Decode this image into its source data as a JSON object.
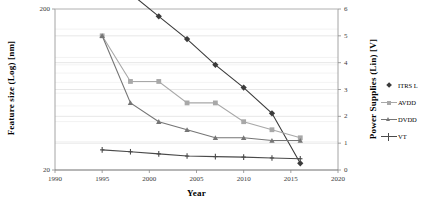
{
  "chart_data": {
    "type": "line",
    "title": "",
    "xlabel": "Year",
    "ylabel_left": "Feature size (Log) [nm]",
    "ylabel_right": "Power Supplies (Lin) [V]",
    "xlim": [
      1990,
      2020
    ],
    "xticks": [
      1990,
      1995,
      2000,
      2005,
      2010,
      2015,
      2020
    ],
    "xtick_labels": [
      "1990",
      "1995",
      "2000",
      "2005",
      "2010",
      "2015",
      "2020"
    ],
    "yleft_scale": "log",
    "yleft_lim": [
      20,
      200
    ],
    "yleft_ticks": [
      20,
      200
    ],
    "yleft_tick_labels": [
      "20",
      "200"
    ],
    "yright_scale": "linear",
    "yright_lim": [
      0,
      6
    ],
    "yright_ticks": [
      0,
      1,
      2,
      3,
      4,
      5,
      6
    ],
    "yright_tick_labels": [
      "0",
      "1",
      "2",
      "3",
      "4",
      "5",
      "6"
    ],
    "grid": true,
    "grid_orientation": "horizontal",
    "legend_position": "right-outside",
    "legend": [
      "ITRS L",
      "AVDD",
      "DVDD",
      "VT"
    ],
    "series": [
      {
        "name": "ITRS L",
        "axis": "left",
        "unit": "nm",
        "marker": "diamond",
        "color": "#3b3b3b",
        "x": [
          1995,
          1998,
          2001,
          2004,
          2007,
          2010,
          2013,
          2016
        ],
        "values": [
          350,
          250,
          180,
          130,
          90,
          65,
          45,
          22
        ]
      },
      {
        "name": "AVDD",
        "axis": "right",
        "unit": "V",
        "marker": "square",
        "color": "#a8a8a8",
        "x": [
          1995,
          1998,
          2001,
          2004,
          2007,
          2010,
          2013,
          2016
        ],
        "values": [
          5.0,
          3.3,
          3.3,
          2.5,
          2.5,
          1.8,
          1.5,
          1.2
        ]
      },
      {
        "name": "DVDD",
        "axis": "right",
        "unit": "V",
        "marker": "triangle",
        "color": "#757575",
        "x": [
          1995,
          1998,
          2001,
          2004,
          2007,
          2010,
          2013,
          2016
        ],
        "values": [
          5.0,
          2.5,
          1.8,
          1.5,
          1.2,
          1.2,
          1.1,
          1.1
        ]
      },
      {
        "name": "VT",
        "axis": "right",
        "unit": "V",
        "marker": "cross",
        "color": "#4a4a4a",
        "x": [
          1995,
          1998,
          2001,
          2004,
          2007,
          2010,
          2013,
          2016
        ],
        "values": [
          0.75,
          0.68,
          0.6,
          0.52,
          0.5,
          0.48,
          0.45,
          0.42
        ]
      }
    ]
  }
}
